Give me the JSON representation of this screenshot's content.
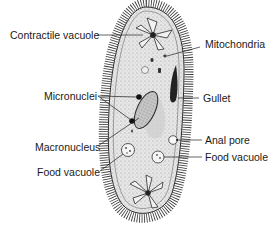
{
  "diagram": {
    "colors": {
      "outline": "#2a2a2a",
      "body_fill": "#dcdcdc",
      "stipple": "#9a9a9a",
      "macronucleus": "#5a5a5a",
      "label_text": "#1a1a1a"
    },
    "labels": {
      "contractile_vacuole": "Contractile vacuole",
      "mitochondria": "Mitochondria",
      "micronuclei": "Micronuclei",
      "gullet": "Gullet",
      "macronucleus": "Macronucleus",
      "anal_pore": "Anal pore",
      "food_vacuole_right": "Food vacuole",
      "food_vacuole_left": "Food vacuole"
    }
  }
}
